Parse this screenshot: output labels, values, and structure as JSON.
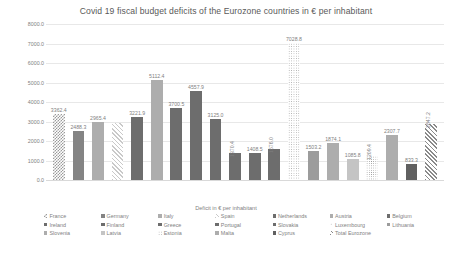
{
  "chart_data": {
    "type": "bar",
    "title": "Covid 19 fiscal budget deficits of the Eurozone countries in € per inhabitant",
    "xlabel": "Deficit in € per inhabitant",
    "ylabel": "",
    "ylim": [
      0,
      8000
    ],
    "grid": true,
    "legend_position": "bottom",
    "y_ticks": [
      "0.0",
      "1000.0",
      "2000.0",
      "3000.0",
      "4000.0",
      "5000.0",
      "6000.0",
      "7000.0",
      "8000.0"
    ],
    "categories": [
      "France",
      "Germany",
      "Italy",
      "Spain",
      "Netherlands",
      "Austria",
      "Belgium",
      "Ireland",
      "Finland",
      "Greece",
      "Portugal",
      "Slovakia",
      "Luxembourg",
      "Lithuania",
      "Slovenia",
      "Latvia",
      "Estonia",
      "Malta",
      "Cyprus",
      "Total Eurozone"
    ],
    "values": [
      3362.4,
      2488.3,
      2965.4,
      2930.0,
      3221.9,
      5112.4,
      3700.5,
      4557.9,
      3125.0,
      1370.4,
      1408.5,
      1576.0,
      7028.8,
      1503.2,
      1874.1,
      1085.8,
      1209.4,
      2307.7,
      833.3,
      2847.2
    ],
    "value_labels": [
      "3362.4",
      "2488.3",
      "2965.4",
      "",
      "3221.9",
      "5112.4",
      "3700.5",
      "4557.9",
      "3125.0",
      "1370.4",
      "1408.5",
      "1576.0",
      "7028.8",
      "1503.2",
      "1874.1",
      "1085.8",
      "1209.4",
      "2307.7",
      "833.3",
      "2847.2"
    ],
    "label_rotated": [
      false,
      false,
      false,
      false,
      false,
      false,
      false,
      false,
      false,
      true,
      false,
      true,
      false,
      false,
      false,
      false,
      true,
      false,
      false,
      true
    ],
    "fills": [
      "f-checker",
      "f-midgray",
      "f-ltgray",
      "f-diag-lt",
      "f-dkgray",
      "f-ltgray",
      "f-dkgray",
      "f-dkgray",
      "f-dkgray",
      "f-dkgray",
      "f-dkgray",
      "f-dkgray",
      "f-dot",
      "f-gray2",
      "f-ltgray",
      "f-verylt",
      "f-dot2",
      "f-ltgray",
      "f-solid-dark",
      "f-diag-dk"
    ]
  },
  "legend": {
    "rows": [
      [
        {
          "label": "France",
          "fill": "f-checker"
        },
        {
          "label": "Germany",
          "fill": "f-midgray"
        },
        {
          "label": "Italy",
          "fill": "f-ltgray"
        },
        {
          "label": "Spain",
          "fill": "f-diag-lt"
        },
        {
          "label": "Netherlands",
          "fill": "f-dkgray"
        },
        {
          "label": "Austria",
          "fill": "f-ltgray"
        },
        {
          "label": "Belgium",
          "fill": "f-dkgray"
        }
      ],
      [
        {
          "label": "Ireland",
          "fill": "f-dkgray"
        },
        {
          "label": "Finland",
          "fill": "f-dkgray"
        },
        {
          "label": "Greece",
          "fill": "f-dkgray"
        },
        {
          "label": "Portugal",
          "fill": "f-dkgray"
        },
        {
          "label": "Slovakia",
          "fill": "f-dkgray"
        },
        {
          "label": "Luxembourg",
          "fill": "f-dot"
        },
        {
          "label": "Lithuania",
          "fill": "f-gray2"
        }
      ],
      [
        {
          "label": "Slovenia",
          "fill": "f-ltgray"
        },
        {
          "label": "Latvia",
          "fill": "f-verylt"
        },
        {
          "label": "Estonia",
          "fill": "f-dot2"
        },
        {
          "label": "Malta",
          "fill": "f-ltgray"
        },
        {
          "label": "Cyprus",
          "fill": "f-solid-dark"
        },
        {
          "label": "Total Eurozone",
          "fill": "f-diag-dk"
        }
      ]
    ]
  },
  "caption": ""
}
